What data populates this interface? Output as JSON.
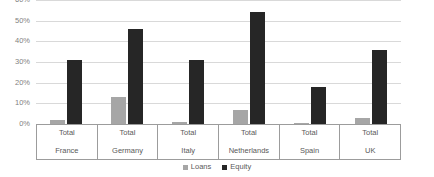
{
  "chart_data": {
    "type": "bar",
    "title": "",
    "subtitle": "",
    "xlabel": "",
    "ylabel": "",
    "ylim": [
      0,
      60
    ],
    "ytick_labels": [
      "60%",
      "50%",
      "40%",
      "30%",
      "20%",
      "10%",
      "0%"
    ],
    "ytick_values": [
      60,
      50,
      40,
      30,
      20,
      10,
      0
    ],
    "grid": true,
    "legend_position": "bottom",
    "categories": [
      "France",
      "Germany",
      "Italy",
      "Netherlands",
      "Spain",
      "UK"
    ],
    "category_prefix": [
      "Total",
      "Total",
      "Total",
      "Total",
      "Total",
      "Total"
    ],
    "series": [
      {
        "name": "Loans",
        "color": "#a6a6a6",
        "values": [
          2,
          13,
          1,
          7,
          0.5,
          3
        ]
      },
      {
        "name": "Equity",
        "color": "#262626",
        "values": [
          31,
          46,
          31,
          54,
          18,
          36
        ]
      }
    ]
  },
  "axis": {
    "ticks": [
      {
        "label": "60%",
        "value": 60
      },
      {
        "label": "50%",
        "value": 50
      },
      {
        "label": "40%",
        "value": 40
      },
      {
        "label": "30%",
        "value": 30
      },
      {
        "label": "20%",
        "value": 20
      },
      {
        "label": "10%",
        "value": 10
      },
      {
        "label": "0%",
        "value": 0
      }
    ]
  },
  "categories": [
    {
      "top": "Total",
      "bottom": "France"
    },
    {
      "top": "Total",
      "bottom": "Germany"
    },
    {
      "top": "Total",
      "bottom": "Italy"
    },
    {
      "top": "Total",
      "bottom": "Netherlands"
    },
    {
      "top": "Total",
      "bottom": "Spain"
    },
    {
      "top": "Total",
      "bottom": "UK"
    }
  ],
  "legend": {
    "items": [
      {
        "label": "Loans",
        "color": "#a6a6a6"
      },
      {
        "label": "Equity",
        "color": "#262626"
      }
    ]
  },
  "colors": {
    "loans": "#a6a6a6",
    "equity": "#262626",
    "gridline": "#d9d9d9",
    "axis_line": "#9c9c9c",
    "text": "#595959",
    "background": "#ffffff"
  }
}
